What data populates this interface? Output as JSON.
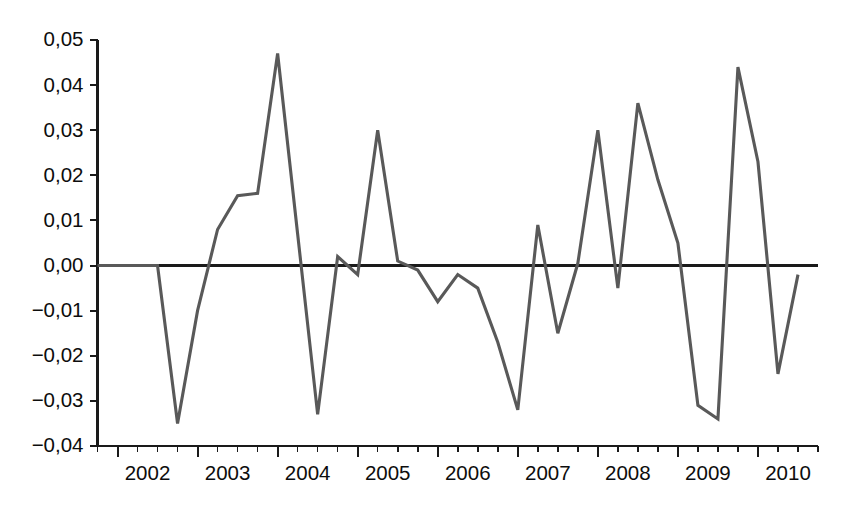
{
  "chart_data": {
    "type": "line",
    "title": "",
    "subtitle": "",
    "xlabel": "",
    "ylabel": "",
    "grid": false,
    "legend": "none",
    "decimal_separator": ",",
    "series_color": "#595959",
    "axis_color": "#1a1a1a",
    "xlim": [
      2001.75,
      2010.75
    ],
    "ylim": [
      -0.04,
      0.05
    ],
    "y_ticks": [
      0.05,
      0.04,
      0.03,
      0.02,
      0.01,
      0.0,
      -0.01,
      -0.02,
      -0.03,
      -0.04
    ],
    "y_tick_labels": [
      "0,05",
      "0,04",
      "0,03",
      "0,02",
      "0,01",
      "0,00",
      "−0,01",
      "−0,02",
      "−0,03",
      "−0,04"
    ],
    "x_tick_labels": [
      "2002",
      "2003",
      "2004",
      "2005",
      "2006",
      "2007",
      "2008",
      "2009",
      "2010"
    ],
    "x_major_ticks": [
      2002.0,
      2003.0,
      2004.0,
      2005.0,
      2006.0,
      2007.0,
      2008.0,
      2009.0,
      2010.0
    ],
    "x_minor_interval": 0.25,
    "x": [
      2001.75,
      2002.0,
      2002.25,
      2002.5,
      2002.75,
      2003.0,
      2003.25,
      2003.5,
      2003.75,
      2004.0,
      2004.25,
      2004.5,
      2004.75,
      2005.0,
      2005.25,
      2005.5,
      2005.75,
      2006.0,
      2006.25,
      2006.5,
      2006.75,
      2007.0,
      2007.25,
      2007.5,
      2007.75,
      2008.0,
      2008.25,
      2008.5,
      2008.75,
      2009.0,
      2009.25,
      2009.5,
      2009.75,
      2010.0,
      2010.25,
      2010.5
    ],
    "values": [
      0.0,
      0.0,
      0.0,
      0.0,
      -0.035,
      -0.01,
      0.008,
      0.0155,
      0.016,
      0.047,
      0.007,
      -0.033,
      0.002,
      -0.002,
      0.03,
      0.001,
      -0.001,
      -0.008,
      -0.002,
      -0.005,
      -0.017,
      -0.032,
      0.009,
      -0.015,
      0.0005,
      0.03,
      -0.005,
      0.036,
      0.019,
      0.005,
      -0.031,
      -0.034,
      0.044,
      0.023,
      -0.024,
      -0.002
    ],
    "annotations": []
  },
  "axes": {
    "y_axis_name": "value-axis",
    "x_axis_name": "year-axis"
  }
}
